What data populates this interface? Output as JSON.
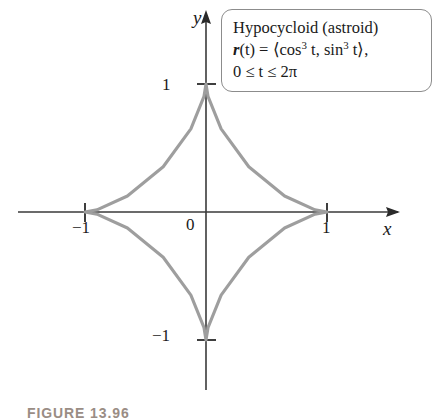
{
  "figure": {
    "caption": "FIGURE 13.96",
    "caption_color": "#9a8d85"
  },
  "callout": {
    "title": "Hypocycloid (astroid)",
    "equation_prefix": "r",
    "equation_body_1": "(t) = ⟨cos",
    "equation_exp_1": "3",
    "equation_body_2": " t, sin",
    "equation_exp_2": "3",
    "equation_body_3": " t⟩,",
    "domain": "0 ≤ t ≤ 2π"
  },
  "axes": {
    "x_label": "x",
    "y_label": "y",
    "origin_label": "0",
    "x_ticks": [
      {
        "label": "−1",
        "value": -1
      },
      {
        "label": "1",
        "value": 1
      }
    ],
    "y_ticks": [
      {
        "label": "1",
        "value": 1
      },
      {
        "label": "−1",
        "value": -1
      }
    ],
    "axis_color": "#3a3a3a"
  },
  "chart_data": {
    "type": "line",
    "title": "Hypocycloid (astroid)",
    "curve_name": "astroid",
    "parametric": {
      "x": "cos^3 t",
      "y": "sin^3 t",
      "t_min": 0,
      "t_max": 6.2832,
      "t_domain_label": "0 ≤ t ≤ 2π"
    },
    "xlabel": "x",
    "ylabel": "y",
    "xlim": [
      -1.55,
      1.6
    ],
    "ylim": [
      -1.4,
      1.6
    ],
    "xticks": [
      -1,
      1
    ],
    "yticks": [
      -1,
      1
    ],
    "grid": false,
    "legend": "none",
    "curve_color": "#9e9e9e",
    "cusps": [
      {
        "x": 1,
        "y": 0
      },
      {
        "x": 0,
        "y": 1
      },
      {
        "x": -1,
        "y": 0
      },
      {
        "x": 0,
        "y": -1
      }
    ],
    "points": [
      {
        "t": 0.0,
        "x": 1.0,
        "y": 0.0
      },
      {
        "t": 0.2618,
        "x": 0.9011,
        "y": 0.0173
      },
      {
        "t": 0.5236,
        "x": 0.6495,
        "y": 0.125
      },
      {
        "t": 0.7854,
        "x": 0.3536,
        "y": 0.3536
      },
      {
        "t": 1.0472,
        "x": 0.125,
        "y": 0.6495
      },
      {
        "t": 1.309,
        "x": 0.0173,
        "y": 0.9011
      },
      {
        "t": 1.5708,
        "x": 0.0,
        "y": 1.0
      },
      {
        "t": 1.8326,
        "x": -0.0173,
        "y": 0.9011
      },
      {
        "t": 2.0944,
        "x": -0.125,
        "y": 0.6495
      },
      {
        "t": 2.3562,
        "x": -0.3536,
        "y": 0.3536
      },
      {
        "t": 2.618,
        "x": -0.6495,
        "y": 0.125
      },
      {
        "t": 2.8798,
        "x": -0.9011,
        "y": 0.0173
      },
      {
        "t": 3.1416,
        "x": -1.0,
        "y": 0.0
      },
      {
        "t": 3.4034,
        "x": -0.9011,
        "y": -0.0173
      },
      {
        "t": 3.6652,
        "x": -0.6495,
        "y": -0.125
      },
      {
        "t": 3.927,
        "x": -0.3536,
        "y": -0.3536
      },
      {
        "t": 4.1888,
        "x": -0.125,
        "y": -0.6495
      },
      {
        "t": 4.4506,
        "x": -0.0173,
        "y": -0.9011
      },
      {
        "t": 4.7124,
        "x": 0.0,
        "y": -1.0
      },
      {
        "t": 4.9742,
        "x": 0.0173,
        "y": -0.9011
      },
      {
        "t": 5.236,
        "x": 0.125,
        "y": -0.6495
      },
      {
        "t": 5.4978,
        "x": 0.3536,
        "y": -0.3536
      },
      {
        "t": 5.7596,
        "x": 0.6495,
        "y": -0.125
      },
      {
        "t": 6.0214,
        "x": 0.9011,
        "y": -0.0173
      },
      {
        "t": 6.2832,
        "x": 1.0,
        "y": 0.0
      }
    ]
  }
}
